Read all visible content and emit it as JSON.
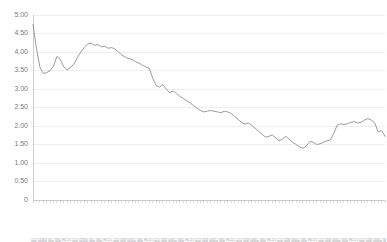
{
  "chart_data": {
    "type": "line",
    "title": "",
    "subtitle": "",
    "xlabel": "",
    "ylabel": "",
    "grid": true,
    "legend": false,
    "ylim": [
      0,
      5.0
    ],
    "ytick_labels": [
      "5.00",
      "4.50",
      "4.00",
      "3.50",
      "3.00",
      "2.50",
      "2.00",
      "1.50",
      "1.00",
      "0.50",
      "0"
    ],
    "ytick_values": [
      5.0,
      4.5,
      4.0,
      3.5,
      3.0,
      2.5,
      2.0,
      1.5,
      1.0,
      0.5,
      0
    ],
    "series": [
      {
        "name": "series-1",
        "color": "#8e8e8e",
        "categories": [
          "2010.01",
          "2010.02",
          "2010.03",
          "2010.04",
          "2010.05",
          "2010.06",
          "2010.07",
          "2010.08",
          "2010.09",
          "2010.10",
          "2010.11",
          "2010.12",
          "2011.01",
          "2011.02",
          "2011.03",
          "2011.04",
          "2011.05",
          "2011.06",
          "2011.07",
          "2011.08",
          "2011.09",
          "2011.10",
          "2011.11",
          "2011.12",
          "2012.01",
          "2012.02",
          "2012.03",
          "2012.04",
          "2012.05",
          "2012.06",
          "2012.07",
          "2012.08",
          "2012.09",
          "2012.10",
          "2012.11",
          "2012.12",
          "2013.01",
          "2013.02",
          "2013.03",
          "2013.04",
          "2013.05",
          "2013.06",
          "2013.07",
          "2013.08",
          "2013.09",
          "2013.10",
          "2013.11",
          "2013.12",
          "2014.01",
          "2014.02",
          "2014.03",
          "2014.04",
          "2014.05",
          "2014.06",
          "2014.07",
          "2014.08",
          "2014.09",
          "2014.10",
          "2014.11",
          "2014.12",
          "2015.01",
          "2015.02",
          "2015.03",
          "2015.04",
          "2015.05",
          "2015.06",
          "2015.07",
          "2015.08",
          "2015.09",
          "2015.10",
          "2015.11",
          "2015.12",
          "2016.01",
          "2016.02",
          "2016.03",
          "2016.04",
          "2016.05",
          "2016.06",
          "2016.07",
          "2016.08",
          "2016.09",
          "2016.10",
          "2016.11",
          "2016.12",
          "2017.01",
          "2017.02",
          "2017.03",
          "2017.04",
          "2017.05",
          "2017.06",
          "2017.07",
          "2017.08",
          "2017.09",
          "2017.10",
          "2017.11",
          "2017.12",
          "2018.01",
          "2018.02",
          "2018.03",
          "2018.04",
          "2018.05",
          "2018.06",
          "2018.07",
          "2018.08"
        ],
        "values": [
          4.75,
          4.1,
          3.6,
          3.42,
          3.44,
          3.5,
          3.62,
          3.88,
          3.8,
          3.6,
          3.52,
          3.58,
          3.68,
          3.85,
          4.0,
          4.12,
          4.22,
          4.24,
          4.18,
          4.2,
          4.14,
          4.16,
          4.1,
          4.12,
          4.08,
          4.0,
          3.92,
          3.86,
          3.82,
          3.8,
          3.74,
          3.7,
          3.64,
          3.6,
          3.56,
          3.3,
          3.1,
          3.05,
          3.12,
          3.0,
          2.9,
          2.95,
          2.88,
          2.8,
          2.74,
          2.68,
          2.62,
          2.55,
          2.48,
          2.42,
          2.38,
          2.4,
          2.42,
          2.4,
          2.38,
          2.36,
          2.4,
          2.38,
          2.34,
          2.26,
          2.18,
          2.1,
          2.05,
          2.08,
          2.02,
          1.94,
          1.86,
          1.78,
          1.7,
          1.72,
          1.76,
          1.68,
          1.6,
          1.65,
          1.72,
          1.64,
          1.56,
          1.5,
          1.44,
          1.4,
          1.46,
          1.58,
          1.56,
          1.5,
          1.52,
          1.56,
          1.6,
          1.62,
          1.8,
          2.02,
          2.06,
          2.04,
          2.06,
          2.1,
          2.12,
          2.08,
          2.1,
          2.16,
          2.2,
          2.16,
          2.08,
          1.84,
          1.88,
          1.72
        ]
      }
    ]
  },
  "axis": {
    "y_min_label": "0",
    "y_max_label": "5.00"
  }
}
